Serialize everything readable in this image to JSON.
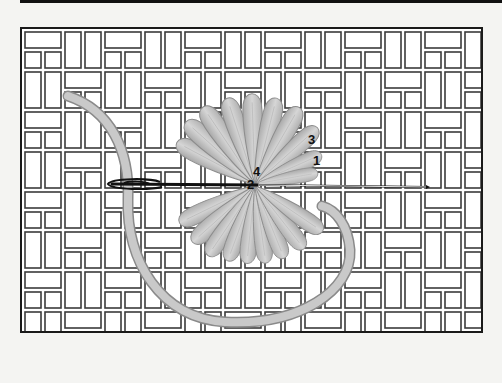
{
  "figure": {
    "colors": {
      "background": "#f4f4f2",
      "canvas_fill": "#ffffff",
      "weave_line": "#3a3a3a",
      "frame": "#1a1a1a",
      "top_rule": "#111111",
      "petal_fill": "#bdbdbd",
      "petal_highlight": "#d9d9d9",
      "petal_outline": "#8c8c8c",
      "thread_fill": "#c4c4c4",
      "thread_outline": "#8a8a8a",
      "needle": "#111111",
      "numbers": "#111111"
    },
    "stitch_numbers": [
      {
        "label": "1",
        "x": 313,
        "y": 165
      },
      {
        "label": "3",
        "x": 308,
        "y": 144
      },
      {
        "label": "4",
        "x": 253,
        "y": 175
      },
      {
        "label": "2",
        "x": 247,
        "y": 189
      }
    ],
    "petal_count_top": 9,
    "petal_count_bottom": 9,
    "center": {
      "x": 255,
      "y": 184
    }
  }
}
